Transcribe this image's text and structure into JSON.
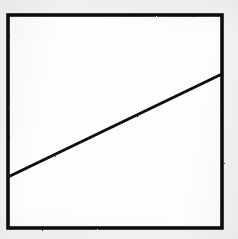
{
  "figure": {
    "kind": "line-drawing",
    "canvas": {
      "width": 238,
      "height": 239,
      "background_color": "#f4f3f1",
      "ink_color": "#0c0c0c"
    },
    "frame": {
      "name": "rectangle-border",
      "left": 8,
      "top": 15,
      "right": 222,
      "bottom": 228,
      "width": 214,
      "height": 213,
      "stroke_width": 3.6,
      "stroke_color": "#0c0c0c",
      "fill_color": "#fdfdfc"
    },
    "diagonal": {
      "name": "ascending-diagonal",
      "x1": 8,
      "y1": 177,
      "x2": 222,
      "y2": 74,
      "stroke_width": 3.0,
      "stroke_color": "#0c0c0c",
      "direction": "rises left-to-right",
      "slope": -0.481,
      "angle_degrees": 25.7
    }
  },
  "chart_data": {
    "type": "line",
    "xlabel": "",
    "ylabel": "",
    "xlim": [
      8,
      222
    ],
    "ylim": [
      15,
      228
    ],
    "grid": false,
    "legend": "none",
    "annotations": [],
    "series": [
      {
        "name": "diagonal",
        "x": [
          8,
          75,
          120,
          222
        ],
        "y": [
          177,
          145,
          123,
          74
        ]
      }
    ],
    "shapes": [
      {
        "type": "rect",
        "name": "border",
        "x": 8,
        "y": 15,
        "width": 214,
        "height": 213,
        "filled": false,
        "stroke_color": "#0c0c0c"
      }
    ]
  }
}
